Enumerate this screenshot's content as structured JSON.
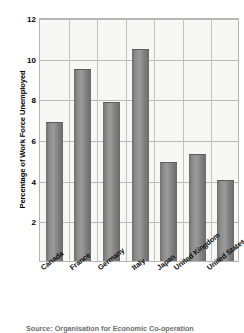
{
  "chart_data": {
    "type": "bar",
    "title": "",
    "xlabel": "",
    "ylabel": "Percentage of Work Force Unemployed",
    "categories": [
      "Canada",
      "France",
      "Germany",
      "Italy",
      "Japan",
      "United Kingdom",
      "United States"
    ],
    "values": [
      6.9,
      9.5,
      7.9,
      10.5,
      4.9,
      5.3,
      4.0
    ],
    "ylim": [
      0,
      12
    ],
    "yticks": [
      2,
      4,
      6,
      8,
      10,
      12
    ],
    "ytick_labels": [
      "2",
      "4",
      "6",
      "8",
      "10",
      "12"
    ],
    "grid": "horizontal-and-vertical",
    "legend": "none",
    "bar_color": "#8b8b8b",
    "plot_background": "#f7f7f5",
    "gridline_color": "#b9b9b9"
  },
  "annotations": {
    "top_clipped_text": "",
    "source_note": "Source: Organisation for Economic Co-operation"
  }
}
